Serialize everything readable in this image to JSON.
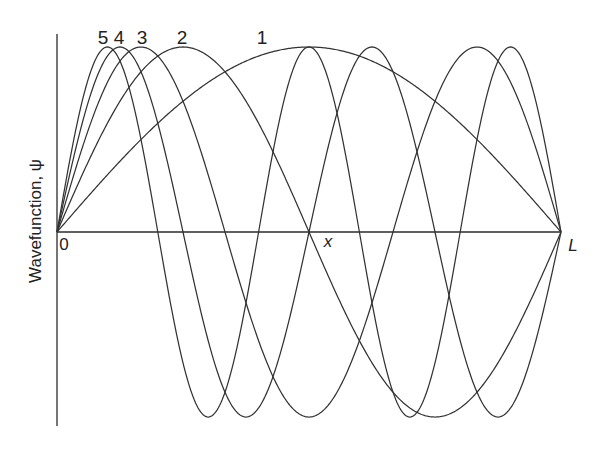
{
  "figure": {
    "title": "",
    "ylabel": "Wavefunction, ψ",
    "xlabel": "x",
    "x_start_label": "0",
    "x_end_label": "L",
    "curve_labels": [
      "5",
      "4",
      "3",
      "2",
      "1"
    ]
  },
  "chart_data": {
    "type": "line",
    "title": "",
    "xlabel": "x",
    "ylabel": "Wavefunction, ψ",
    "x_ticks": [
      "0",
      "L"
    ],
    "x_range": [
      0,
      1
    ],
    "y_range": [
      -1,
      1
    ],
    "grid": false,
    "legend": "numeric labels above each curve's first maximum",
    "function": "ψ_n(x) = sin(nπx/L)",
    "series": [
      {
        "name": "1",
        "n": 1,
        "maxima_x": [
          0.5
        ],
        "minima_x": [],
        "nodes_x": [
          0,
          1
        ]
      },
      {
        "name": "2",
        "n": 2,
        "maxima_x": [
          0.25
        ],
        "minima_x": [
          0.75
        ],
        "nodes_x": [
          0,
          0.5,
          1
        ]
      },
      {
        "name": "3",
        "n": 3,
        "maxima_x": [
          0.1667,
          0.8333
        ],
        "minima_x": [
          0.5
        ],
        "nodes_x": [
          0,
          0.3333,
          0.6667,
          1
        ]
      },
      {
        "name": "4",
        "n": 4,
        "maxima_x": [
          0.125,
          0.625
        ],
        "minima_x": [
          0.375,
          0.875
        ],
        "nodes_x": [
          0,
          0.25,
          0.5,
          0.75,
          1
        ]
      },
      {
        "name": "5",
        "n": 5,
        "maxima_x": [
          0.1,
          0.5,
          0.9
        ],
        "minima_x": [
          0.3,
          0.7
        ],
        "nodes_x": [
          0,
          0.2,
          0.4,
          0.6,
          0.8,
          1
        ]
      }
    ]
  },
  "layout": {
    "origin_px": [
      57,
      232
    ],
    "end_px": [
      561,
      232
    ],
    "amplitude_px": 185,
    "yaxis_top_px": 34,
    "yaxis_bottom_px": 426
  }
}
